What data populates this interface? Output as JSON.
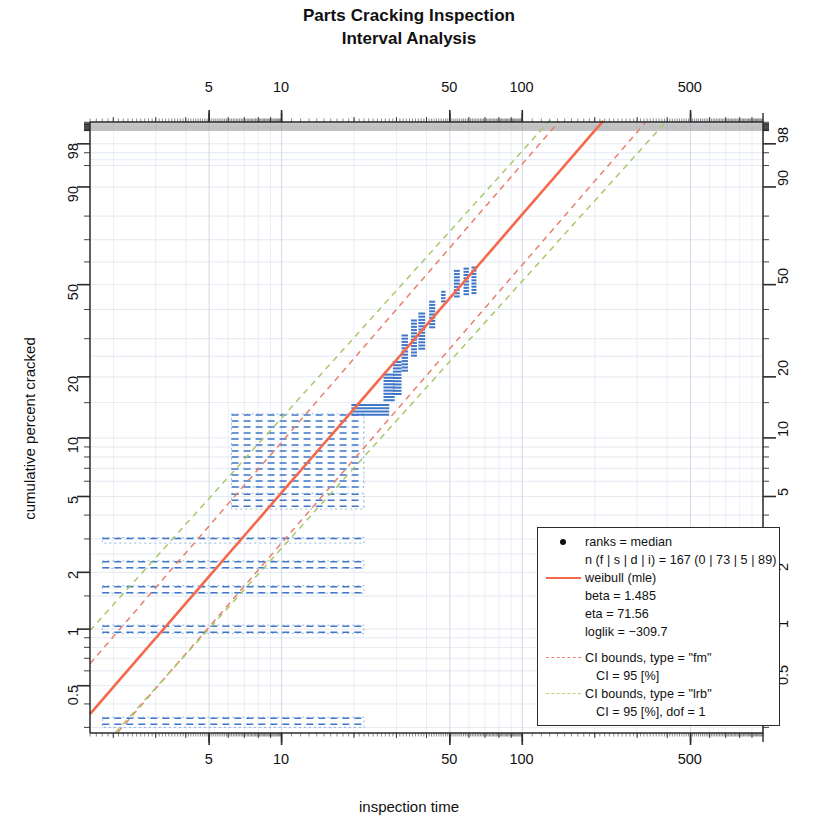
{
  "chart_data": {
    "type": "scatter",
    "plot_kind": "weibull-probability-plot",
    "title": "Parts Cracking Inspection",
    "subtitle": "Interval Analysis",
    "xlabel": "inspection time",
    "ylabel": "cumulative percent cracked",
    "x_scale": "log10",
    "y_scale": "weibull",
    "xlim": [
      1.6,
      1000
    ],
    "ylim_percent": [
      0.28,
      99.4
    ],
    "x_ticks": [
      5,
      10,
      50,
      100,
      500
    ],
    "x_tick_labels": [
      "5",
      "10",
      "50",
      "100",
      "500"
    ],
    "y_ticks_percent": [
      0.5,
      1,
      2,
      5,
      10,
      20,
      50,
      90,
      98
    ],
    "y_tick_labels": [
      "0.5",
      "1",
      "2",
      "5",
      "10",
      "20",
      "50",
      "90",
      "98"
    ],
    "grid": true,
    "axes_mirrored": true,
    "legend_position": "bottom-right",
    "fit": {
      "distribution": "weibull",
      "method": "mle",
      "beta": 1.485,
      "eta": 71.56,
      "loglik": -309.7,
      "color": "#F4694B"
    },
    "confidence_bounds": [
      {
        "type": "fm",
        "ci_percent": 95,
        "color": "#E8806E",
        "style": "dashed"
      },
      {
        "type": "lrb",
        "ci_percent": 95,
        "dof": 1,
        "color": "#A8C86A",
        "style": "dashed"
      }
    ],
    "sample": {
      "n_total": 167,
      "failures": 0,
      "suspensions": 73,
      "discrete": 5,
      "intervals": 89,
      "ranks": "median"
    },
    "interval_boxes": [
      {
        "x_left": 1.8,
        "x_right": 22.0,
        "y_low": 0.3,
        "y_high": 0.34,
        "kind": "wide"
      },
      {
        "x_left": 1.8,
        "x_right": 22.0,
        "y_low": 0.95,
        "y_high": 1.05,
        "kind": "wide"
      },
      {
        "x_left": 1.8,
        "x_right": 22.0,
        "y_low": 1.55,
        "y_high": 1.7,
        "kind": "wide"
      },
      {
        "x_left": 1.8,
        "x_right": 22.0,
        "y_low": 2.1,
        "y_high": 2.3,
        "kind": "wide"
      },
      {
        "x_left": 1.8,
        "x_right": 22.0,
        "y_low": 2.85,
        "y_high": 3.05,
        "kind": "wide"
      },
      {
        "x_left": 6.2,
        "x_right": 22.0,
        "y_low": 4.3,
        "y_high": 5.2,
        "kind": "wide"
      },
      {
        "x_left": 6.2,
        "x_right": 22.0,
        "y_low": 5.6,
        "y_high": 13.2,
        "kind": "wide"
      },
      {
        "x_left": 19.5,
        "x_right": 28.0,
        "y_low": 13.0,
        "y_high": 14.6,
        "kind": "narrow"
      },
      {
        "x_left": 26.5,
        "x_right": 29.5,
        "y_low": 15.0,
        "y_high": 20.5,
        "kind": "narrow"
      },
      {
        "x_left": 29.0,
        "x_right": 31.5,
        "y_low": 16.5,
        "y_high": 23.5,
        "kind": "narrow"
      },
      {
        "x_left": 31.5,
        "x_right": 33.5,
        "y_low": 21.0,
        "y_high": 31.0,
        "kind": "narrow"
      },
      {
        "x_left": 34.5,
        "x_right": 36.5,
        "y_low": 25.0,
        "y_high": 36.0,
        "kind": "narrow"
      },
      {
        "x_left": 37.0,
        "x_right": 39.5,
        "y_low": 27.0,
        "y_high": 38.5,
        "kind": "narrow"
      },
      {
        "x_left": 41.0,
        "x_right": 43.5,
        "y_low": 33.0,
        "y_high": 43.0,
        "kind": "narrow"
      },
      {
        "x_left": 46.0,
        "x_right": 48.0,
        "y_low": 42.0,
        "y_high": 47.0,
        "kind": "narrow"
      },
      {
        "x_left": 52.0,
        "x_right": 55.0,
        "y_low": 44.0,
        "y_high": 56.0,
        "kind": "narrow"
      },
      {
        "x_left": 57.0,
        "x_right": 60.0,
        "y_low": 45.0,
        "y_high": 57.0,
        "kind": "narrow"
      },
      {
        "x_left": 61.5,
        "x_right": 64.5,
        "y_low": 45.5,
        "y_high": 57.5,
        "kind": "narrow"
      }
    ]
  },
  "title": {
    "line1": "Parts Cracking Inspection",
    "line2": "Interval Analysis"
  },
  "axes": {
    "x_label": "inspection time",
    "y_label": "cumulative percent cracked",
    "x_tick_labels": [
      "5",
      "10",
      "50",
      "100",
      "500"
    ],
    "y_tick_labels": [
      "0.5",
      "1",
      "2",
      "5",
      "10",
      "20",
      "50",
      "90",
      "98"
    ]
  },
  "legend": {
    "ranks_label": "ranks = median",
    "n_label": "n (f | s | d | i) = 167 (0 | 73 | 5 | 89)",
    "fit_label": "weibull (mle)",
    "beta_label": "beta = 1.485",
    "eta_label": "eta = 71.56",
    "loglik_label": "loglik = −309.7",
    "ci_fm_label": "CI bounds, type = \"fm\"",
    "ci_fm_value": "CI = 95 [%]",
    "ci_lrb_label": "CI bounds, type = \"lrb\"",
    "ci_lrb_value": "CI = 95 [%], dof = 1"
  }
}
